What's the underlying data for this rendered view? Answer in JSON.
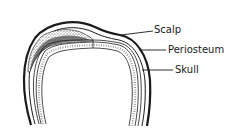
{
  "diagram": {
    "labels": {
      "scalp": "Scalp",
      "periosteum": "Periosteum",
      "skull": "Skull"
    },
    "colors": {
      "ink": "#1a1a1a",
      "background": "#ffffff",
      "stipple": "#555555"
    }
  }
}
